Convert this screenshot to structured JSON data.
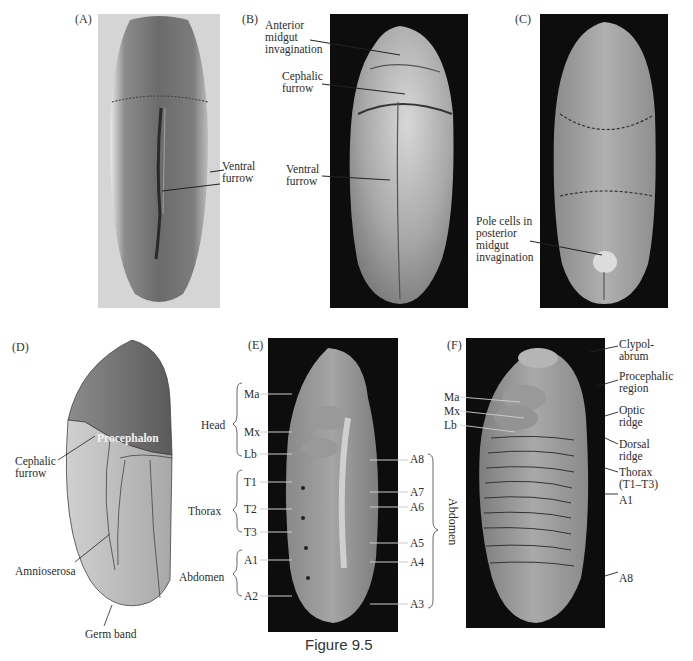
{
  "figure": {
    "caption": "Figure 9.5",
    "panels": {
      "A": {
        "id": "(A)",
        "background": "#d9d9d9",
        "labels": {
          "ventral_furrow": "Ventral\nfurrow"
        }
      },
      "B": {
        "id": "(B)",
        "background": "#0d0d0d",
        "labels": {
          "anterior_midgut": "Anterior\nmidgut\ninvagination",
          "cephalic_furrow": "Cephalic\nfurrow",
          "ventral_furrow": "Ventral\nfurrow"
        }
      },
      "C": {
        "id": "(C)",
        "background": "#0d0d0d",
        "labels": {
          "pole_cells": "Pole cells in\nposterior\nmidgut\ninvagination"
        }
      },
      "D": {
        "id": "(D)",
        "labels": {
          "procephalon": "Procephalon",
          "cephalic_furrow": "Cephalic\nfurrow",
          "amnioserosa": "Amnioserosa",
          "germ_band": "Germ band"
        },
        "colors": {
          "procephalon": "#6f6f6f",
          "body": "#bdbdbd",
          "band": "#a9a9a9"
        }
      },
      "E": {
        "id": "(E)",
        "background": "#0d0d0d",
        "groups_left": [
          {
            "name": "Head",
            "segments": [
              "Ma",
              "Mx",
              "Lb"
            ]
          },
          {
            "name": "Thorax",
            "segments": [
              "T1",
              "T2",
              "T3"
            ]
          },
          {
            "name": "Abdomen",
            "segments": [
              "A1",
              "A2"
            ]
          }
        ],
        "segments_right": [
          "A8",
          "A7",
          "A6",
          "A5",
          "A4",
          "A3"
        ],
        "group_right": "Abdomen"
      },
      "F": {
        "id": "(F)",
        "background": "#0d0d0d",
        "labels_left": [
          "Ma",
          "Mx",
          "Lb"
        ],
        "labels_right": {
          "clypolabrum": "Clypol-\nabrum",
          "procephalic": "Procephalic\nregion",
          "optic": "Optic\nridge",
          "dorsal": "Dorsal\nridge",
          "thorax": "Thorax\n(T1–T3)",
          "a1": "A1",
          "a8": "A8"
        }
      }
    }
  }
}
